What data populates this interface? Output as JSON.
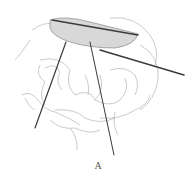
{
  "figure": {
    "panel_label": "A",
    "colors": {
      "line": "#9a9a9a",
      "instrument": "#3a3a3a",
      "organ_fill": "#d8d8d8",
      "background": "#ffffff"
    }
  }
}
